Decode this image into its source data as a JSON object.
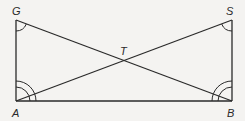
{
  "diagram": {
    "type": "geometry",
    "points": {
      "G": {
        "label": "G",
        "x": 16,
        "y": 20
      },
      "S": {
        "label": "S",
        "x": 232,
        "y": 20
      },
      "A": {
        "label": "A",
        "x": 16,
        "y": 101
      },
      "B": {
        "label": "B",
        "x": 232,
        "y": 101
      },
      "T": {
        "label": "T",
        "x": 124,
        "y": 60
      }
    },
    "segments": [
      "GA",
      "SB",
      "AB",
      "GB",
      "SA"
    ],
    "angle_marks": [
      {
        "vertex": "G",
        "arcs": 1,
        "between": [
          "GA",
          "GB"
        ]
      },
      {
        "vertex": "S",
        "arcs": 1,
        "between": [
          "SB",
          "SA"
        ]
      },
      {
        "vertex": "A",
        "arcs": 2,
        "between": [
          "AG",
          "AB"
        ]
      },
      {
        "vertex": "B",
        "arcs": 2,
        "between": [
          "BS",
          "BA"
        ]
      }
    ],
    "stroke_color": "#2a2a2a",
    "background_color": "#f4f3f1"
  }
}
